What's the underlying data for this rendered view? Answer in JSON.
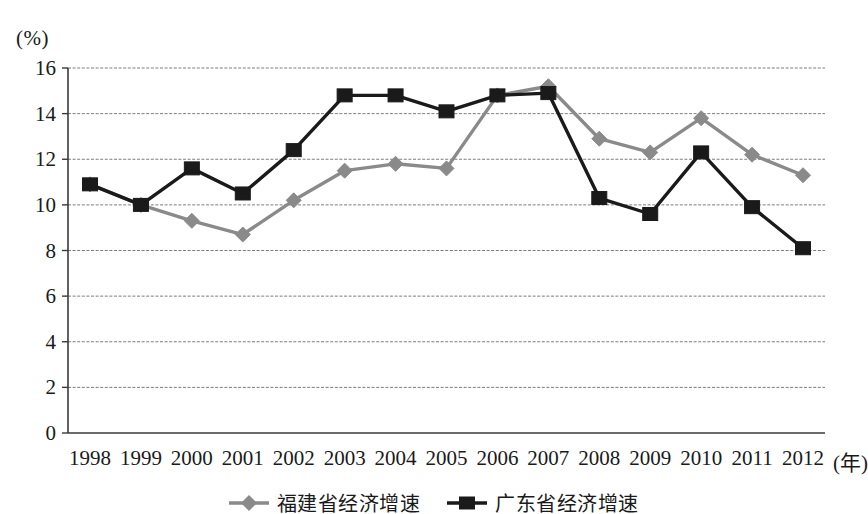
{
  "chart_data": {
    "type": "line",
    "title": "",
    "xlabel": "(年)",
    "ylabel": "(%)",
    "categories": [
      "1998",
      "1999",
      "2000",
      "2001",
      "2002",
      "2003",
      "2004",
      "2005",
      "2006",
      "2007",
      "2008",
      "2009",
      "2010",
      "2011",
      "2012"
    ],
    "x_tick_labels": [
      "1998",
      "1999",
      "2000",
      "2001",
      "2002",
      "2003",
      "2004",
      "2005",
      "2006",
      "2007",
      "2008",
      "2009",
      "2010",
      "2011",
      "2012"
    ],
    "y_tick_labels": [
      "16",
      "14",
      "12",
      "10",
      "8",
      "6",
      "4",
      "2",
      "0"
    ],
    "ylim": [
      0,
      16
    ],
    "y_step": 2,
    "grid": true,
    "legend_position": "bottom-center",
    "series": [
      {
        "name": "福建省经济增速",
        "color": "#8a8a8a",
        "marker": "diamond",
        "values": [
          10.9,
          10.0,
          9.3,
          8.7,
          10.2,
          11.5,
          11.8,
          11.6,
          14.8,
          15.2,
          12.9,
          12.3,
          13.8,
          12.2,
          11.3
        ]
      },
      {
        "name": "广东省经济增速",
        "color": "#1a1a1a",
        "marker": "square",
        "values": [
          10.9,
          10.0,
          11.6,
          10.5,
          12.4,
          14.8,
          14.8,
          14.1,
          14.8,
          14.9,
          10.3,
          9.6,
          12.3,
          9.9,
          8.1
        ]
      }
    ]
  },
  "legend": {
    "items": [
      {
        "label": "福建省经济增速"
      },
      {
        "label": "广东省经济增速"
      }
    ]
  },
  "axes": {
    "y_unit": "(%)",
    "x_unit": "(年)"
  }
}
